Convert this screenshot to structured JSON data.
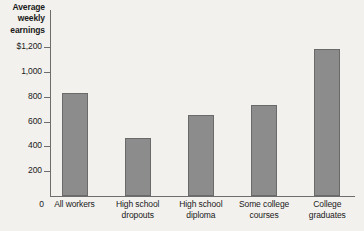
{
  "chart_data": {
    "type": "bar",
    "title": "Average weekly earnings",
    "xlabel": "",
    "ylabel": "Average weekly earnings",
    "categories": [
      "All workers",
      "High school dropouts",
      "High school diploma",
      "Some college courses",
      "College graduates"
    ],
    "category_lines": [
      [
        "All workers"
      ],
      [
        "High school",
        "dropouts"
      ],
      [
        "High school",
        "diploma"
      ],
      [
        "Some college",
        "courses"
      ],
      [
        "College",
        "graduates"
      ]
    ],
    "values": [
      830,
      465,
      655,
      730,
      1185
    ],
    "ylim": [
      0,
      1290
    ],
    "yticks": [
      0,
      200,
      400,
      600,
      800,
      1000,
      1200
    ],
    "ytick_labels": [
      "0",
      "200",
      "400",
      "600",
      "800",
      "1,000",
      "$1,200"
    ],
    "grid": false,
    "legend": null,
    "bar_color": "#8c8c8c",
    "bar_border_color": "#6a6a6a",
    "axis_color": "#6d6d6d",
    "background_color": "#f2f1ee"
  },
  "title_lines": {
    "line1": "Average",
    "line2": "weekly",
    "line3": "earnings"
  }
}
